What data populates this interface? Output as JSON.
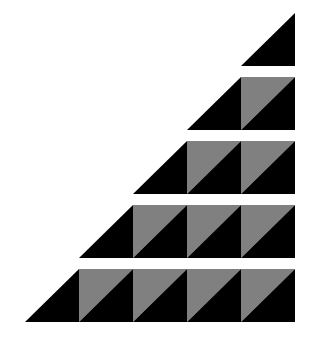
{
  "figure": {
    "description": "Staircase of triangle rows: each row n has one black right triangle on the left followed by n-1 squares split diagonally into gray (upper-left) and black (lower-right) halves.",
    "rows": 5,
    "cell_width": 54,
    "row_height": 53,
    "row_gap": 11,
    "right_edge_x": 295,
    "top_y": 13,
    "colors": {
      "background": "#ffffff",
      "dark": "#000000",
      "light": "#808080"
    },
    "row_squares": [
      0,
      1,
      2,
      3,
      4
    ]
  }
}
